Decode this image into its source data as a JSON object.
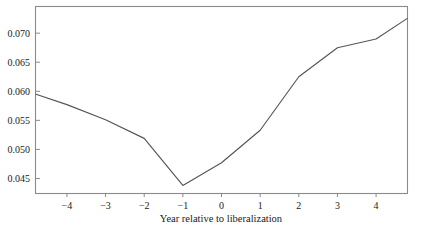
{
  "chart_data": {
    "type": "line",
    "title": "",
    "subtitle": "",
    "xlabel": "Year relative to liberalization",
    "ylabel": "",
    "xlim": [
      -4.8,
      4.8
    ],
    "ylim": [
      0.0425,
      0.0745
    ],
    "grid": false,
    "legend": false,
    "legend_position": "none",
    "x_ticks": [
      -4,
      -3,
      -2,
      -1,
      0,
      1,
      2,
      3,
      4
    ],
    "x_tick_labels": [
      "−4",
      "−3",
      "−2",
      "−1",
      "0",
      "1",
      "2",
      "3",
      "4"
    ],
    "y_ticks": [
      0.045,
      0.05,
      0.055,
      0.06,
      0.065,
      0.07
    ],
    "y_tick_labels": [
      "0.045",
      "0.050",
      "0.055",
      "0.060",
      "0.065",
      "0.070"
    ],
    "series": [
      {
        "name": "series-1",
        "color": "#555555",
        "x": [
          -4.8,
          -4,
          -3,
          -2,
          -1,
          0,
          1,
          2,
          3,
          4,
          4.8
        ],
        "values": [
          0.0595,
          0.0577,
          0.0551,
          0.0519,
          0.0438,
          0.0477,
          0.0533,
          0.0625,
          0.0675,
          0.069,
          0.0725
        ]
      }
    ]
  },
  "colors": {
    "frame": "#8a8a8a",
    "line": "#555555",
    "text": "#1a1a1a",
    "background": "#ffffff"
  }
}
